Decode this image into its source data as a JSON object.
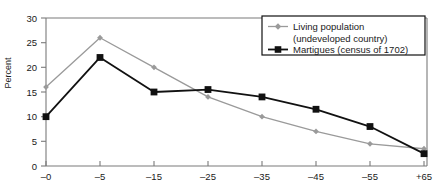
{
  "chart_data": {
    "type": "line",
    "title": "",
    "xlabel": "",
    "ylabel": "Percent",
    "ylim": [
      0,
      30
    ],
    "ytick_step": 5,
    "yticks": [
      "0",
      "5",
      "10",
      "15",
      "20",
      "25",
      "30"
    ],
    "grid": false,
    "legend_position": "top-right",
    "categories": [
      "–0",
      "–5",
      "–15",
      "–25",
      "–35",
      "–45",
      "–55",
      "+65"
    ],
    "series": [
      {
        "name": "Living population (undeveloped country)",
        "legend_line1": "Living population",
        "legend_line2": "(undeveloped country)",
        "color": "#9a9a9a",
        "marker": "diamond",
        "values": [
          16,
          26,
          20,
          14,
          10,
          7,
          4.5,
          3.5
        ]
      },
      {
        "name": "Martigues (census of 1702)",
        "legend_line1": "Martigues (census of 1702)",
        "legend_line2": "",
        "color": "#111111",
        "marker": "square",
        "values": [
          10,
          22,
          15,
          15.5,
          14,
          11.5,
          8,
          2.5
        ]
      }
    ]
  },
  "axes": {
    "y_axis_title": "Percent"
  },
  "colors": {
    "series_gray": "#9a9a9a",
    "series_black": "#111111",
    "frame": "#7a7a7a",
    "legend_border": "#111111",
    "text": "#1a1a1a"
  }
}
